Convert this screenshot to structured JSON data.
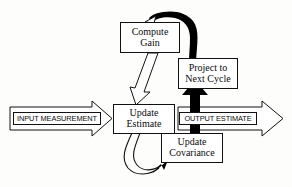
{
  "diagram": {
    "type": "flow-diagram",
    "colors": {
      "background": "#fdfdfb",
      "stroke": "#111111",
      "box_fill": "#ffffff",
      "thick_arrow": "#000000"
    },
    "nodes": [
      {
        "id": "compute-gain",
        "lines": [
          "Compute",
          "Gain"
        ]
      },
      {
        "id": "project-next-cycle",
        "lines": [
          "Project to",
          "Next Cycle"
        ]
      },
      {
        "id": "update-estimate",
        "lines": [
          "Update",
          "Estimate"
        ]
      },
      {
        "id": "update-covariance",
        "lines": [
          "Update",
          "Covariance"
        ]
      }
    ],
    "io": [
      {
        "id": "input-measurement",
        "label": "INPUT MEASUREMENT"
      },
      {
        "id": "output-estimate",
        "label": "OUTPUT ESTIMATE"
      }
    ],
    "edges": [
      {
        "id": "gain-to-estimate",
        "style": "hollow-block-arrow",
        "from": "compute-gain",
        "to": "update-estimate"
      },
      {
        "id": "estimate-to-covariance",
        "style": "thin-curve-solid-head",
        "from": "update-estimate",
        "to": "update-covariance"
      },
      {
        "id": "covariance-to-project",
        "style": "thick-straight-arrow",
        "from": "update-covariance",
        "to": "project-next-cycle"
      },
      {
        "id": "project-to-gain",
        "style": "thick-curve-arrow",
        "from": "project-next-cycle",
        "to": "compute-gain"
      },
      {
        "id": "measurement-in",
        "style": "hollow-block-arrow",
        "from": "input-measurement",
        "to": "update-estimate"
      },
      {
        "id": "estimate-out",
        "style": "hollow-block-arrow",
        "from": "update-estimate",
        "to": "output-estimate"
      }
    ]
  }
}
